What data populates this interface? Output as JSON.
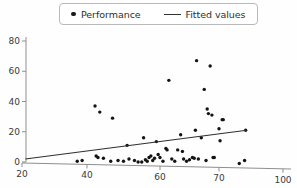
{
  "chart_data": {
    "type": "scatter",
    "title": "",
    "xlabel": "",
    "ylabel": "",
    "grid": false,
    "legend_position": "top-center",
    "xlim": [
      20,
      100
    ],
    "ylim": [
      0,
      80
    ],
    "xticks": [
      20,
      40,
      60,
      70,
      100
    ],
    "yticks": [
      0,
      20,
      40,
      60,
      80
    ],
    "xtick_labels": [
      "20",
      "40",
      "60",
      "70",
      "100"
    ],
    "ytick_labels": [
      "0",
      "20",
      "40",
      "60",
      "80"
    ],
    "series": [
      {
        "name": "Performance",
        "marker": "dot",
        "color": "#141414",
        "points": [
          [
            37.0,
            0.5
          ],
          [
            38.5,
            1.0
          ],
          [
            42.2,
            37.0
          ],
          [
            42.5,
            4.0
          ],
          [
            43.0,
            3.0
          ],
          [
            43.5,
            33.0
          ],
          [
            44.5,
            2.5
          ],
          [
            46.5,
            0.5
          ],
          [
            47.0,
            29.0
          ],
          [
            48.5,
            1.0
          ],
          [
            50.0,
            0.5
          ],
          [
            51.0,
            11.0
          ],
          [
            51.5,
            2.0
          ],
          [
            53.0,
            1.0
          ],
          [
            54.0,
            0.0
          ],
          [
            55.0,
            0.0
          ],
          [
            55.5,
            16.0
          ],
          [
            56.0,
            1.5
          ],
          [
            56.5,
            0.5
          ],
          [
            57.0,
            3.0
          ],
          [
            57.5,
            4.0
          ],
          [
            58.0,
            1.0
          ],
          [
            58.5,
            2.5
          ],
          [
            59.0,
            13.5
          ],
          [
            59.5,
            5.0
          ],
          [
            60.0,
            3.0
          ],
          [
            60.5,
            0.5
          ],
          [
            61.0,
            9.0
          ],
          [
            61.2,
            8.0
          ],
          [
            61.5,
            54.0
          ],
          [
            62.0,
            2.0
          ],
          [
            62.5,
            0.5
          ],
          [
            63.0,
            8.0
          ],
          [
            63.5,
            18.0
          ],
          [
            63.8,
            7.0
          ],
          [
            64.0,
            2.0
          ],
          [
            64.5,
            0.5
          ],
          [
            65.0,
            1.5
          ],
          [
            65.5,
            3.0
          ],
          [
            65.8,
            2.5
          ],
          [
            66.0,
            21.0
          ],
          [
            66.2,
            67.0
          ],
          [
            66.5,
            2.0
          ],
          [
            67.0,
            16.0
          ],
          [
            67.5,
            48.0
          ],
          [
            67.8,
            1.0
          ],
          [
            68.0,
            35.0
          ],
          [
            68.2,
            32.0
          ],
          [
            68.5,
            63.5
          ],
          [
            68.8,
            31.0
          ],
          [
            69.0,
            3.0
          ],
          [
            69.2,
            3.0
          ],
          [
            70.0,
            22.0
          ],
          [
            70.5,
            14.0
          ],
          [
            71.5,
            28.0
          ],
          [
            72.0,
            28.0
          ],
          [
            79.5,
            -1.0
          ],
          [
            82.0,
            1.0
          ],
          [
            82.5,
            21.0
          ]
        ]
      },
      {
        "name": "Fitted values",
        "marker": "line",
        "color": "#2f2f2f",
        "line": [
          [
            21.0,
            2.0
          ],
          [
            83.0,
            21.0
          ]
        ]
      }
    ]
  },
  "legend": {
    "entries": [
      {
        "label": "Performance",
        "marker": "dot"
      },
      {
        "label": "Fitted values",
        "marker": "line"
      }
    ]
  }
}
